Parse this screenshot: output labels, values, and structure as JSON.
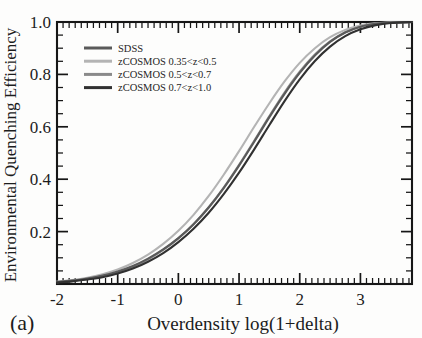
{
  "panel": {
    "label": "(a)"
  },
  "chart_data": {
    "type": "line",
    "title": "",
    "xlabel": "Overdensity log(1+delta)",
    "ylabel": "Environmental Quenching Efficiency",
    "xlim": [
      -2.0,
      3.85
    ],
    "ylim": [
      0.0,
      1.0
    ],
    "xticks": [
      -2,
      -1,
      0,
      1,
      2,
      3
    ],
    "xticklabels": [
      "-2",
      "-1",
      "0",
      "1",
      "2",
      "3"
    ],
    "yticks": [
      0.2,
      0.4,
      0.6,
      0.8,
      1.0
    ],
    "yticklabels": [
      "0.2",
      "0.4",
      "0.6",
      "0.8",
      "1.0"
    ],
    "x_minor_step": 0.1,
    "y_minor_step": 0.05,
    "grid": false,
    "legend_position": "upper-left",
    "x": [
      -2.0,
      -1.75,
      -1.5,
      -1.25,
      -1.0,
      -0.75,
      -0.5,
      -0.25,
      0.0,
      0.25,
      0.5,
      0.75,
      1.0,
      1.25,
      1.5,
      1.75,
      2.0,
      2.25,
      2.5,
      2.75,
      3.0,
      3.25,
      3.5,
      3.85
    ],
    "series": [
      {
        "name": "SDSS",
        "color": "#5a5a5a",
        "linewidth": 2.1,
        "values": [
          0.008,
          0.013,
          0.021,
          0.032,
          0.048,
          0.069,
          0.097,
          0.132,
          0.175,
          0.228,
          0.292,
          0.367,
          0.452,
          0.543,
          0.637,
          0.726,
          0.806,
          0.872,
          0.924,
          0.96,
          0.982,
          0.993,
          0.998,
          1.0
        ]
      },
      {
        "name": "zCOSMOS 0.35<z<0.5",
        "color": "#b4b4b4",
        "linewidth": 2.1,
        "values": [
          0.009,
          0.015,
          0.024,
          0.037,
          0.055,
          0.08,
          0.112,
          0.153,
          0.203,
          0.264,
          0.336,
          0.418,
          0.507,
          0.6,
          0.69,
          0.773,
          0.844,
          0.9,
          0.942,
          0.97,
          0.987,
          0.995,
          0.999,
          1.0
        ]
      },
      {
        "name": "zCOSMOS 0.5<z<0.7",
        "color": "#8a8a8a",
        "linewidth": 2.1,
        "values": [
          0.007,
          0.012,
          0.019,
          0.03,
          0.045,
          0.066,
          0.094,
          0.13,
          0.174,
          0.228,
          0.293,
          0.369,
          0.455,
          0.547,
          0.641,
          0.731,
          0.81,
          0.876,
          0.926,
          0.961,
          0.982,
          0.993,
          0.998,
          1.0
        ]
      },
      {
        "name": "zCOSMOS 0.7<z<1.0",
        "color": "#313131",
        "linewidth": 2.1,
        "values": [
          0.006,
          0.01,
          0.017,
          0.026,
          0.04,
          0.059,
          0.085,
          0.118,
          0.16,
          0.211,
          0.272,
          0.344,
          0.425,
          0.514,
          0.607,
          0.698,
          0.781,
          0.851,
          0.906,
          0.946,
          0.972,
          0.988,
          0.996,
          1.0
        ]
      }
    ]
  },
  "legend": {
    "entries": [
      {
        "label": "SDSS",
        "color": "#5a5a5a"
      },
      {
        "label": "zCOSMOS 0.35<z<0.5",
        "color": "#b4b4b4"
      },
      {
        "label": "zCOSMOS 0.5<z<0.7",
        "color": "#8a8a8a"
      },
      {
        "label": "zCOSMOS 0.7<z<1.0",
        "color": "#313131"
      }
    ]
  }
}
